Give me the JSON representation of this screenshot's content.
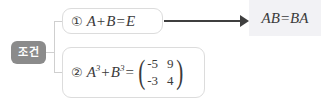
{
  "diagram": {
    "type": "condition-to-conclusion",
    "badge": {
      "label": "조건",
      "background_color": "#8b8b8b",
      "text_color": "#ffffff"
    },
    "conditions": [
      {
        "marker": "①",
        "expression": "A+B=E",
        "parts": {
          "lhs_a": "A",
          "plus": "+",
          "lhs_b": "B",
          "equals": "=",
          "rhs": "E"
        }
      },
      {
        "marker": "②",
        "expression": "A³+B³=(-5 9; -3 4)",
        "parts": {
          "lhs_a": "A",
          "lhs_a_exp": "3",
          "plus": "+",
          "lhs_b": "B",
          "lhs_b_exp": "3",
          "equals": "="
        },
        "matrix": {
          "rows": 2,
          "cols": 2,
          "values": [
            [
              "-5",
              "9"
            ],
            [
              "-3",
              "4"
            ]
          ],
          "open_paren": "(",
          "close_paren": ")"
        }
      }
    ],
    "arrow": {
      "direction": "right",
      "color": "#3f3f3f"
    },
    "result": {
      "expression": "AB=BA",
      "background_color": "#f2f2f5"
    }
  }
}
